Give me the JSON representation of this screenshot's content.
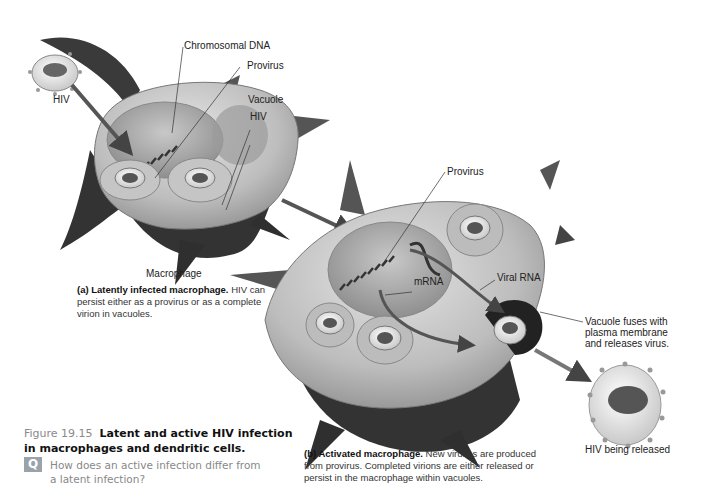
{
  "figure": {
    "number": "Figure 19.15",
    "title": "Latent and active HIV infection in macrophages and dendritic cells.",
    "question_icon": "Q",
    "question": "How does an active infection differ from a latent infection?"
  },
  "panel_a": {
    "labels": {
      "hiv_outside": "HIV",
      "chromosomal_dna": "Chromosomal DNA",
      "provirus": "Provirus",
      "vacuole": "Vacuole",
      "hiv_in_vacuole": "HIV",
      "cell": "Macrophage"
    },
    "caption_bold": "(a) Latently infected macrophage.",
    "caption_text": " HIV can persist either as a provirus or as a complete virion in vacuoles."
  },
  "panel_b": {
    "labels": {
      "provirus": "Provirus",
      "mrna": "mRNA",
      "viral_rna": "Viral RNA",
      "vacuole_fuses_1": "Vacuole fuses with",
      "vacuole_fuses_2": "plasma membrane",
      "vacuole_fuses_3": "and releases virus.",
      "hiv_released": "HIV being released"
    },
    "caption_bold": "(b) Activated macrophage.",
    "caption_text": " New viruses are produced from provirus. Completed virions are either released or persist in the macrophage within vacuoles."
  },
  "colors": {
    "cell_dark": "#3a3a3a",
    "cell_mid": "#8e8e8e",
    "cell_light": "#d6d6d6",
    "nucleus": "#a8a8a8",
    "arrow": "#555555",
    "figure_number": "#8a8a8a",
    "question_icon_bg": "#9aa3ab"
  }
}
